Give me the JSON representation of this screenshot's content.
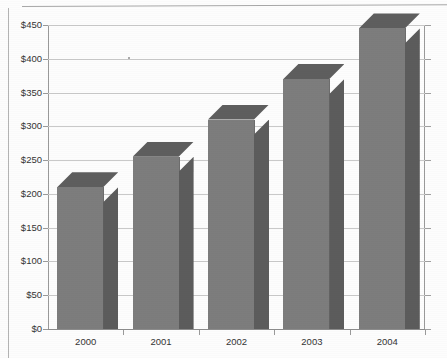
{
  "chart_data": {
    "type": "bar",
    "title": "",
    "subtitle": "",
    "xlabel": "",
    "ylabel": "",
    "categories": [
      "2000",
      "2001",
      "2002",
      "2003",
      "2004"
    ],
    "values": [
      210,
      255,
      310,
      370,
      445
    ],
    "ylim": [
      0,
      450
    ],
    "ytick_labels": [
      "$0",
      "$50",
      "$100",
      "$150",
      "$200",
      "$250",
      "$300",
      "$350",
      "$400",
      "$450"
    ],
    "ytick_values": [
      0,
      50,
      100,
      150,
      200,
      250,
      300,
      350,
      400,
      450
    ],
    "grid": true,
    "legend": null,
    "series": [
      {
        "name": "",
        "values": [
          210,
          255,
          310,
          370,
          445
        ]
      }
    ],
    "style": "3d-column",
    "colors": {
      "bar_front": "#7d7d7d",
      "bar_side": "#5c5c5c",
      "bar_top": "#5e5e5e",
      "gridline": "#c9c9c9",
      "axis": "#9a9a9a",
      "text": "#343434",
      "background": "#fdfdfd"
    }
  }
}
